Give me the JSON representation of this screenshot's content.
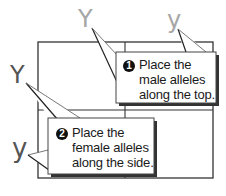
{
  "diagram": {
    "type": "punnett-square-instructions",
    "colors": {
      "male_allele": "#a6a6a6",
      "female_allele": "#555555",
      "grid_line": "#333333",
      "callout_fill": "#ffffff",
      "callout_shadow": "#333333",
      "text": "#1a1a1a"
    },
    "alleles": {
      "male_top_left": {
        "symbol": "Y",
        "position": "top-left column"
      },
      "male_top_right": {
        "symbol": "y",
        "position": "top-right column"
      },
      "female_left_top": {
        "symbol": "Y",
        "position": "left top row"
      },
      "female_left_bottom": {
        "symbol": "y",
        "position": "left bottom row"
      }
    },
    "callouts": [
      {
        "number": "1",
        "lines": [
          "Place the",
          "male alleles",
          "along the top."
        ]
      },
      {
        "number": "2",
        "lines": [
          "Place the",
          "female alleles",
          "along the side."
        ]
      }
    ]
  }
}
